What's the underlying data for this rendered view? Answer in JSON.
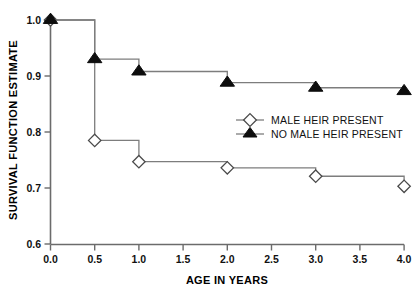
{
  "chart_data": {
    "type": "line",
    "title": "",
    "subtitle": "",
    "xlabel": "AGE IN YEARS",
    "ylabel": "SURVIVAL FUNCTION ESTIMATE",
    "xlim": [
      0.0,
      4.0
    ],
    "ylim": [
      0.6,
      1.0
    ],
    "xticks": [
      "0.0",
      "0.5",
      "1.0",
      "1.5",
      "2.0",
      "2.5",
      "3.0",
      "3.5",
      "4.0"
    ],
    "xtick_values": [
      0.0,
      0.5,
      1.0,
      1.5,
      2.0,
      2.5,
      3.0,
      3.5,
      4.0
    ],
    "yticks": [
      "0.6",
      "0.7",
      "0.8",
      "0.9",
      "1.0"
    ],
    "ytick_values": [
      0.6,
      0.7,
      0.8,
      0.9,
      1.0
    ],
    "grid": false,
    "legend_position": "center-right",
    "step_type": "post",
    "series": [
      {
        "name": "MALE HEIR PRESENT",
        "marker": "open-diamond",
        "color": "#7d7d7d",
        "x": [
          0.0,
          0.5,
          1.0,
          2.0,
          3.0,
          4.0
        ],
        "values": [
          1.0,
          0.785,
          0.747,
          0.736,
          0.721,
          0.703
        ]
      },
      {
        "name": "NO MALE HEIR PRESENT",
        "marker": "filled-triangle",
        "color": "#7d7d7d",
        "x": [
          0.0,
          0.5,
          1.0,
          2.0,
          3.0,
          4.0
        ],
        "values": [
          1.0,
          0.93,
          0.908,
          0.888,
          0.879,
          0.873
        ]
      }
    ]
  },
  "legend": {
    "entries": [
      {
        "label": "MALE HEIR PRESENT",
        "marker": "open-diamond"
      },
      {
        "label": "NO MALE HEIR PRESENT",
        "marker": "filled-triangle"
      }
    ]
  }
}
